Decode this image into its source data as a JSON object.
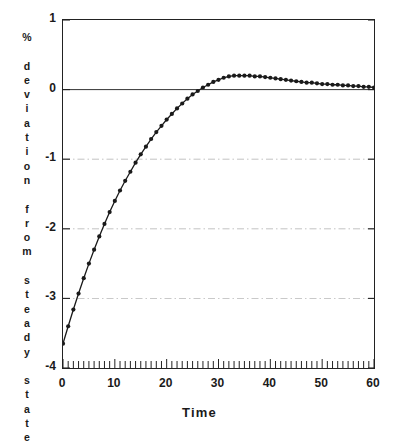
{
  "chart_data": {
    "type": "line",
    "title": "",
    "top_partial_text": "",
    "xlabel": "Time",
    "ylabel_vertical": "% deviation from steady state",
    "ylabel_chars": [
      "%",
      "",
      "d",
      "e",
      "v",
      "i",
      "a",
      "t",
      "i",
      "o",
      "n",
      "",
      "f",
      "r",
      "o",
      "m",
      "",
      "s",
      "t",
      "e",
      "a",
      "d",
      "y",
      "",
      "s",
      "t",
      "a",
      "t",
      "e"
    ],
    "xlim": [
      0,
      60
    ],
    "ylim": [
      -4,
      1
    ],
    "xticks": [
      0,
      10,
      20,
      30,
      40,
      50,
      60
    ],
    "xtick_labels": [
      "0",
      "10",
      "20",
      "30",
      "40",
      "50",
      "60"
    ],
    "yticks": [
      1,
      0,
      -1,
      -2,
      -3,
      -4
    ],
    "ytick_labels": [
      "1",
      "0",
      "-1",
      "-2",
      "-3",
      "-4"
    ],
    "minor_xtick_interval": 1,
    "grid": "dash-dot horizontal gridlines at -1, -2, -3; solid zero line at 0",
    "gridlines": [
      -1,
      -2,
      -3
    ],
    "zero_line": 0,
    "marker": "filled-circle",
    "line_color": "#1a1a1a",
    "grid_color": "#9a9a9a",
    "axis_color": "#222222",
    "background_color": "#ffffff",
    "series": [
      {
        "name": "deviation",
        "x": [
          0,
          1,
          2,
          3,
          4,
          5,
          6,
          7,
          8,
          9,
          10,
          11,
          12,
          13,
          14,
          15,
          16,
          17,
          18,
          19,
          20,
          21,
          22,
          23,
          24,
          25,
          26,
          27,
          28,
          29,
          30,
          31,
          32,
          33,
          34,
          35,
          36,
          37,
          38,
          39,
          40,
          41,
          42,
          43,
          44,
          45,
          46,
          47,
          48,
          49,
          50,
          51,
          52,
          53,
          54,
          55,
          56,
          57,
          58,
          59,
          60
        ],
        "values": [
          -3.65,
          -3.4,
          -3.16,
          -2.93,
          -2.71,
          -2.5,
          -2.3,
          -2.11,
          -1.93,
          -1.76,
          -1.6,
          -1.45,
          -1.31,
          -1.18,
          -1.05,
          -0.93,
          -0.82,
          -0.71,
          -0.61,
          -0.52,
          -0.43,
          -0.35,
          -0.27,
          -0.2,
          -0.13,
          -0.07,
          -0.02,
          0.03,
          0.07,
          0.11,
          0.14,
          0.17,
          0.19,
          0.2,
          0.2,
          0.2,
          0.2,
          0.19,
          0.19,
          0.18,
          0.17,
          0.16,
          0.15,
          0.14,
          0.13,
          0.12,
          0.11,
          0.1,
          0.1,
          0.09,
          0.08,
          0.08,
          0.07,
          0.07,
          0.06,
          0.06,
          0.05,
          0.05,
          0.04,
          0.04,
          0.03
        ]
      }
    ],
    "annotations": {
      "initial_value": -3.65,
      "peak_value": 0.2,
      "peak_time": 33,
      "zero_crossing_time": 26.5,
      "final_value": 0.03
    }
  }
}
